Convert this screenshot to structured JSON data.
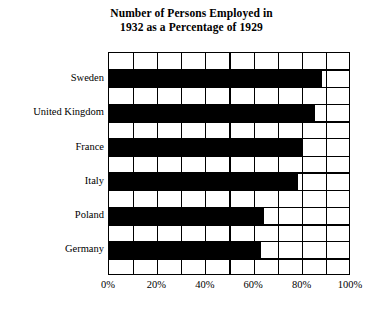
{
  "chart_data": {
    "type": "bar",
    "orientation": "horizontal",
    "title": "Number of Persons Employed in 1932 as a Percentage of 1929",
    "title_lines": [
      "Number of Persons Employed in",
      "1932 as a Percentage of 1929"
    ],
    "xlabel": "",
    "ylabel": "",
    "categories": [
      "Sweden",
      "United Kingdom",
      "France",
      "Italy",
      "Poland",
      "Germany"
    ],
    "values": [
      88,
      85,
      80,
      78,
      64,
      63
    ],
    "value_suffix": "%",
    "xlim": [
      0,
      100
    ],
    "xticks": [
      0,
      20,
      40,
      60,
      80,
      100
    ],
    "xtick_labels": [
      "0%",
      "20%",
      "40%",
      "60%",
      "80%",
      "100%"
    ],
    "minor_gridline_step": 10,
    "grid": true,
    "grid_color": "#000000",
    "bar_color": "#000000",
    "plot_background": "#ffffff",
    "legend": null,
    "legend_position": "none"
  }
}
